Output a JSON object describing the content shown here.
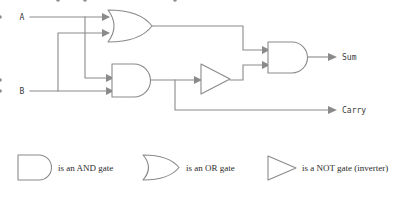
{
  "diagram": {
    "type": "logic-circuit-schematic",
    "background_color": "#ffffff",
    "wire_color": "#8a8a8a",
    "text_color": "#2b2b2b",
    "io_label_color": "#3a3a3a"
  },
  "inputs": [
    {
      "id": "A",
      "label": "A",
      "x": 22,
      "y": 17,
      "wire_y": 17
    },
    {
      "id": "B",
      "label": "B",
      "x": 22,
      "y": 91,
      "wire_y": 91
    }
  ],
  "outputs": [
    {
      "id": "sum",
      "label": "Sum",
      "x": 338,
      "y": 60
    },
    {
      "id": "carry",
      "label": "Carry",
      "x": 338,
      "y": 110
    }
  ],
  "gates": [
    {
      "id": "or1",
      "kind": "OR",
      "x": 108,
      "y": 10,
      "width": 44,
      "height": 32,
      "inputs": [
        "A",
        "B"
      ],
      "output": "a_or_b"
    },
    {
      "id": "and1",
      "kind": "AND",
      "x": 112,
      "y": 64,
      "width": 38,
      "height": 33,
      "inputs": [
        "A",
        "B"
      ],
      "output": "a_and_b"
    },
    {
      "id": "not1",
      "kind": "NOT",
      "x": 201,
      "y": 64,
      "width": 29,
      "height": 30,
      "inputs": [
        "a_and_b"
      ],
      "output": "not_a_and_b"
    },
    {
      "id": "and2",
      "kind": "AND",
      "x": 268,
      "y": 42,
      "width": 40,
      "height": 31,
      "inputs": [
        "a_or_b",
        "not_a_and_b"
      ],
      "output": "sum"
    }
  ],
  "wires": {
    "a_trunk": "M 30 17 L 108 17",
    "a_branch_down": "M 85 17 L 85 78 L 112 78",
    "b_trunk": "M 30 91 L 112 91",
    "b_branch_up": "M 58 91 L 58 33 L 108 33",
    "or_out": "M 152 26 L 243 26 L 243 50 L 268 50",
    "and1_out": "M 150 80 L 201 80",
    "carry_branch": "M 175 80 L 175 110 L 330 110",
    "not_out": "M 230 80 L 243 80 L 243 65 L 268 65",
    "and2_out": "M 308 57 L 330 57"
  },
  "junctions": [
    {
      "id": "a-branch-junction",
      "x": 85,
      "y": 17
    },
    {
      "id": "b-branch-junction",
      "x": 58,
      "y": 91
    },
    {
      "id": "carry-tap-junction",
      "x": 175,
      "y": 80
    }
  ],
  "legend": {
    "items": [
      {
        "id": "and",
        "symbol": "AND",
        "text": "is an AND gate",
        "shape_x": 18,
        "shape_y": 155,
        "shape_w": 34,
        "shape_h": 25,
        "text_x": 58,
        "text_y": 171
      },
      {
        "id": "or",
        "symbol": "OR",
        "text": "is an OR gate",
        "shape_x": 143,
        "shape_y": 155,
        "shape_w": 36,
        "shape_h": 25,
        "text_x": 186,
        "text_y": 171
      },
      {
        "id": "not",
        "symbol": "NOT",
        "text": "is a NOT gate (inverter)",
        "shape_x": 268,
        "shape_y": 156,
        "shape_w": 28,
        "shape_h": 24,
        "text_x": 302,
        "text_y": 171
      }
    ]
  }
}
